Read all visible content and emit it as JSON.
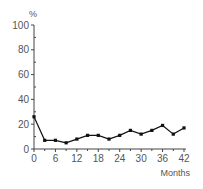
{
  "chart_data": {
    "type": "line",
    "title": "",
    "xlabel": "Months",
    "ylabel": "%",
    "xlim": [
      0,
      42
    ],
    "ylim": [
      0,
      100
    ],
    "x_ticks": [
      0,
      6,
      12,
      18,
      24,
      30,
      36,
      42
    ],
    "x_tick_labels": [
      "0",
      "6",
      "12",
      "18",
      "24",
      "30",
      "36",
      "42"
    ],
    "y_ticks": [
      0,
      20,
      40,
      60,
      80,
      100
    ],
    "y_tick_labels": [
      "0",
      "20",
      "40",
      "60",
      "80",
      "100"
    ],
    "grid": false,
    "series": [
      {
        "name": "rate",
        "color": "#111111",
        "x": [
          0,
          3,
          6,
          9,
          12,
          15,
          18,
          21,
          24,
          27,
          30,
          33,
          36,
          39,
          42
        ],
        "values": [
          26,
          7,
          7,
          5,
          8,
          11,
          11,
          8,
          11,
          15,
          12,
          15,
          19,
          12,
          17
        ]
      }
    ]
  }
}
